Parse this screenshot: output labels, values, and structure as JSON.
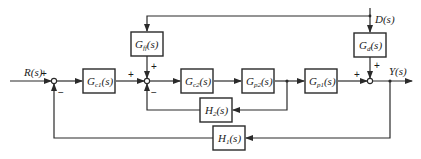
{
  "diagram": {
    "signals": {
      "input": "R(s)",
      "disturbance": "D(s)",
      "output": "Y(s)"
    },
    "blocks": {
      "gc1": {
        "base": "G",
        "sub": "c1",
        "arg": "(s)"
      },
      "gff": {
        "base": "G",
        "sub": "ff",
        "arg": "(s)"
      },
      "gc2": {
        "base": "G",
        "sub": "c2",
        "arg": "(s)"
      },
      "gp2": {
        "base": "G",
        "sub": "p2",
        "arg": "(s)"
      },
      "gp1": {
        "base": "G",
        "sub": "p1",
        "arg": "(s)"
      },
      "gd": {
        "base": "G",
        "sub": "d",
        "arg": "(s)"
      },
      "h2": {
        "base": "H",
        "sub": "2",
        "arg": "(s)"
      },
      "h1": {
        "base": "H",
        "sub": "1",
        "arg": "(s)"
      }
    },
    "signs": {
      "sum1_input": "+",
      "sum1_feedback": "−",
      "sum2_input": "+",
      "sum2_feedforward": "+",
      "sum2_feedback": "−",
      "sum3_input": "+",
      "sum3_disturbance": "+"
    }
  }
}
